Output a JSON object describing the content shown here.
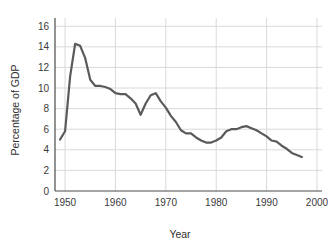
{
  "chart_data": {
    "type": "line",
    "title": "",
    "xlabel": "Year",
    "ylabel": "Percentage of GDP",
    "xlim": [
      1948,
      2001
    ],
    "ylim": [
      0,
      16.8
    ],
    "xticks": [
      1950,
      1960,
      1970,
      1980,
      1990,
      2000
    ],
    "xtick_labels": [
      "1950",
      "1960",
      "1970",
      "1980",
      "1990",
      "2000"
    ],
    "yticks": [
      0,
      2,
      4,
      6,
      8,
      10,
      12,
      14,
      16
    ],
    "ytick_labels": [
      "0",
      "2",
      "4",
      "6",
      "8",
      "10",
      "12",
      "14",
      "16"
    ],
    "grid": true,
    "grid_color": "#d9d9d9",
    "line_color": "#5a5a5a",
    "line_width": 2.2,
    "legend": null,
    "legend_position": "none",
    "x": [
      1949,
      1950,
      1951,
      1952,
      1953,
      1954,
      1955,
      1956,
      1957,
      1958,
      1959,
      1960,
      1961,
      1962,
      1963,
      1964,
      1965,
      1966,
      1967,
      1968,
      1969,
      1970,
      1971,
      1972,
      1973,
      1974,
      1975,
      1976,
      1977,
      1978,
      1979,
      1980,
      1981,
      1982,
      1983,
      1984,
      1985,
      1986,
      1987,
      1988,
      1989,
      1990,
      1991,
      1992,
      1993,
      1994,
      1995,
      1996,
      1997
    ],
    "values": [
      5.0,
      5.8,
      11.1,
      14.3,
      14.1,
      12.9,
      10.8,
      10.2,
      10.2,
      10.1,
      9.9,
      9.5,
      9.4,
      9.4,
      9.0,
      8.5,
      7.4,
      8.5,
      9.3,
      9.5,
      8.7,
      8.1,
      7.3,
      6.7,
      5.9,
      5.6,
      5.6,
      5.2,
      4.9,
      4.7,
      4.7,
      4.9,
      5.2,
      5.8,
      6.0,
      6.0,
      6.2,
      6.3,
      6.1,
      5.9,
      5.6,
      5.3,
      4.9,
      4.8,
      4.4,
      4.1,
      3.7,
      3.5,
      3.3
    ]
  },
  "axis": {
    "x_title": "Year",
    "y_title": "Percentage of GDP"
  }
}
